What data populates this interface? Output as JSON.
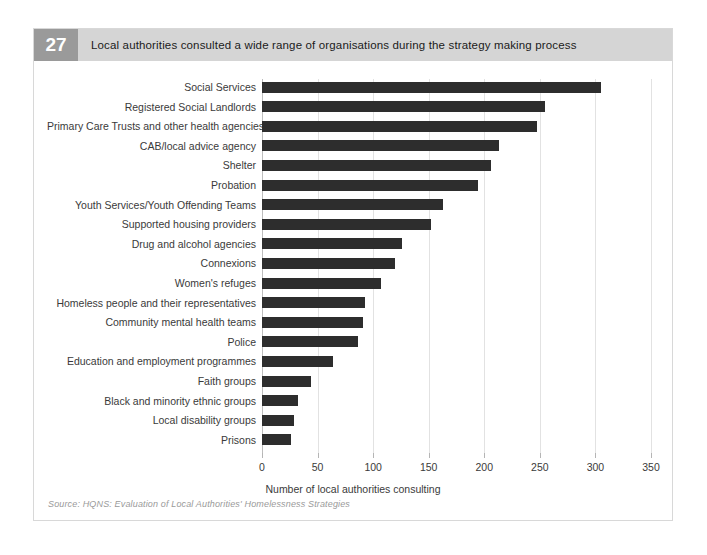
{
  "figure": {
    "number": "27",
    "headline": "Local authorities consulted a wide range of organisations during the strategy making process",
    "source": "Source: HQNS: Evaluation of Local Authorities' Homelessness Strategies"
  },
  "colors": {
    "bar": "#2d2d2d",
    "header_bar": "#d5d5d5",
    "badge": "#9a9a9a",
    "grid": "#e2e2e2",
    "axis": "#bdbdbd",
    "text": "#3a3a3a",
    "source_text": "#9a9a9a",
    "panel_border": "#d8d8d8",
    "background": "#ffffff"
  },
  "chart_data": {
    "type": "bar",
    "orientation": "horizontal",
    "title": "Local authorities consulted a wide range of organisations during the strategy making process",
    "subtitle": "",
    "xlabel": "Number of local authorities consulting",
    "ylabel": "",
    "xlim": [
      0,
      350
    ],
    "ylim": null,
    "grid": "vertical",
    "legend": null,
    "xticks": [
      0,
      50,
      100,
      150,
      200,
      250,
      300,
      350
    ],
    "xticklabels": [
      "0",
      "50",
      "100",
      "150",
      "200",
      "250",
      "300",
      "350"
    ],
    "categories": [
      "Social Services",
      "Registered Social Landlords",
      "Primary Care Trusts and other health agencies",
      "CAB/local advice agency",
      "Shelter",
      "Probation",
      "Youth Services/Youth Offending Teams",
      "Supported housing providers",
      "Drug and alcohol agencies",
      "Connexions",
      "Women's refuges",
      "Homeless people and their representatives",
      "Community mental health teams",
      "Police",
      "Education and employment programmes",
      "Faith groups",
      "Black and minority ethnic groups",
      "Local disability groups",
      "Prisons"
    ],
    "values": [
      305,
      255,
      247,
      213,
      206,
      194,
      163,
      152,
      126,
      120,
      107,
      93,
      91,
      86,
      64,
      44,
      32,
      29,
      26
    ]
  }
}
